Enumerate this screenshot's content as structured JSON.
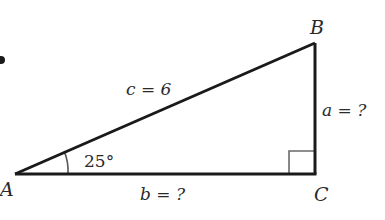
{
  "diagram": {
    "type": "right-triangle",
    "vertices": {
      "A": {
        "label": "A",
        "x": 15,
        "y": 174
      },
      "B": {
        "label": "B",
        "x": 315,
        "y": 43
      },
      "C": {
        "label": "C",
        "x": 315,
        "y": 174
      }
    },
    "sides": {
      "c": {
        "var": "c",
        "text": "c = 6",
        "value": "6",
        "between": "A-B"
      },
      "a": {
        "var": "a",
        "text": "a = ?",
        "value": "?",
        "between": "B-C"
      },
      "b": {
        "var": "b",
        "text": "b = ?",
        "value": "?",
        "between": "A-C"
      }
    },
    "angle": {
      "vertex": "A",
      "text": "25°",
      "degrees": 25
    },
    "right_angle": {
      "vertex": "C"
    },
    "colors": {
      "line": "#1a1a1a",
      "arc": "#555555",
      "right_angle_mark": "#6a6a6a",
      "text": "#2a2a2a",
      "background": "#ffffff"
    }
  }
}
